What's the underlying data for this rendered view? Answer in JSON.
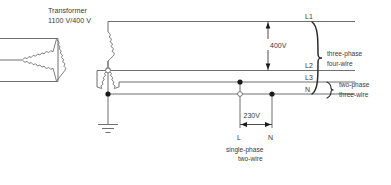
{
  "diagram": {
    "title_lines": [
      "Transformer",
      "1100 V/400 V"
    ],
    "transformer": {
      "primary_symbol": "delta-winding",
      "secondary_symbol": "wye-winding",
      "ratio_label": "1100 V/400 V",
      "name_label": "Transformer"
    },
    "bus_lines": [
      {
        "id": "L1",
        "label": "L1"
      },
      {
        "id": "L2",
        "label": "L2"
      },
      {
        "id": "L3",
        "label": "L3"
      },
      {
        "id": "N",
        "label": "N"
      }
    ],
    "voltages": {
      "line_to_line": "400V",
      "line_to_neutral": "230V"
    },
    "system_brackets": [
      {
        "lines": [
          "three-phase",
          "four-wire"
        ]
      },
      {
        "lines": [
          "two-phase",
          "three-wire"
        ]
      }
    ],
    "single_phase": {
      "terminals": [
        "L",
        "N"
      ],
      "lines": [
        "single-phase",
        "two-wire"
      ]
    },
    "earth": {
      "symbol": "earth-ground-icon"
    },
    "colors": {
      "wire": "#6f6f6f",
      "text": "#3a3a3a",
      "brace": "#2b2b2b",
      "node": "#1a1a1a",
      "background": "#ffffff"
    }
  }
}
